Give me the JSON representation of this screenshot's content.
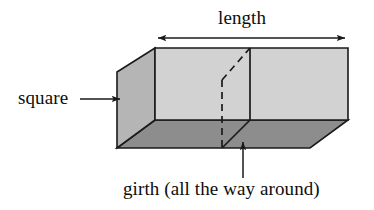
{
  "figure": {
    "labels": {
      "length": "length",
      "square": "square",
      "girth": "girth (all the way around)"
    },
    "icons": {
      "length_arrow": "double-headed-arrow-icon",
      "square_arrow": "right-arrow-icon",
      "girth_arrow": "up-arrow-icon",
      "box": "rectangular-box-icon",
      "girth_band": "dashed-band-icon"
    },
    "colors": {
      "front_face": "#d2d2d2",
      "left_face": "#b5b5b5",
      "bottom_face": "#8d8d8d",
      "outline": "#1a1a1a",
      "background": "#ffffff",
      "text": "#0d0d0d"
    },
    "geometry": {
      "front_face_points": "155,48 348,48 348,120 155,120",
      "left_face_points": "117,72 155,48 155,120 117,148",
      "bottom_face_points": "117,148 155,120 348,120 310,148",
      "girth_front_line": "250,48 250,120",
      "girth_bottom_line": "250,120 222,148",
      "girth_dashed_diagonal": "222,80 250,48",
      "girth_dashed_vertical": "222,80 222,148",
      "length_arrow_line": "155,38 348,38",
      "square_arrow_line": "80,99 122,99",
      "girth_arrow_line": "243,178 243,140"
    }
  }
}
